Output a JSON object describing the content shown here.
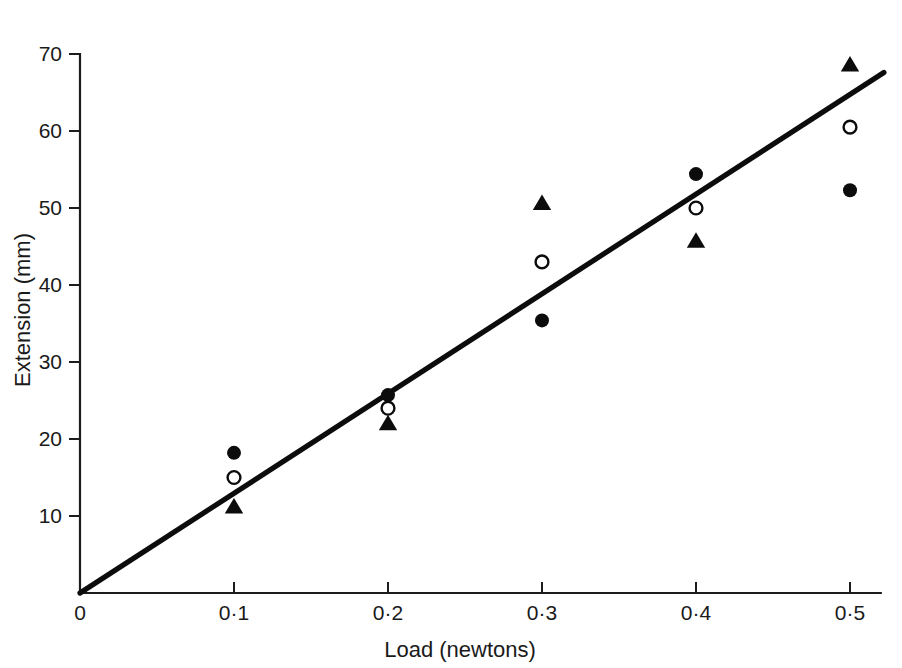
{
  "chart_data": {
    "type": "scatter",
    "title": "",
    "xlabel": "Load (newtons)",
    "ylabel": "Extension (mm)",
    "xlim": [
      0,
      0.52
    ],
    "ylim": [
      0,
      70
    ],
    "grid": false,
    "legend_position": "none",
    "x": [
      0.1,
      0.2,
      0.3,
      0.4,
      0.5
    ],
    "xtick_labels": [
      "0",
      "0·1",
      "0·2",
      "0·3",
      "0·4",
      "0·5"
    ],
    "xtick_values": [
      0,
      0.1,
      0.2,
      0.3,
      0.4,
      0.5
    ],
    "ytick_labels": [
      "10",
      "20",
      "30",
      "40",
      "50",
      "60",
      "70"
    ],
    "ytick_values": [
      10,
      20,
      30,
      40,
      50,
      60,
      70
    ],
    "series": [
      {
        "name": "filled-circle",
        "marker": "filled-circle",
        "values": [
          18.2,
          25.7,
          35.4,
          54.4,
          52.3
        ]
      },
      {
        "name": "open-circle",
        "marker": "open-circle",
        "values": [
          15.0,
          24.0,
          43.0,
          50.0,
          60.5
        ]
      },
      {
        "name": "filled-triangle",
        "marker": "filled-triangle",
        "values": [
          11.1,
          21.9,
          50.5,
          45.6,
          68.5
        ]
      }
    ],
    "fit_line": {
      "name": "best-fit-line",
      "x_start": 0,
      "y_start": 0,
      "x_end": 0.522,
      "y_end": 67.6
    },
    "colors": {
      "axis": "#1c1c1c",
      "line": "#0c0c0c",
      "marker": "#0c0c0c",
      "background": "#ffffff"
    }
  }
}
